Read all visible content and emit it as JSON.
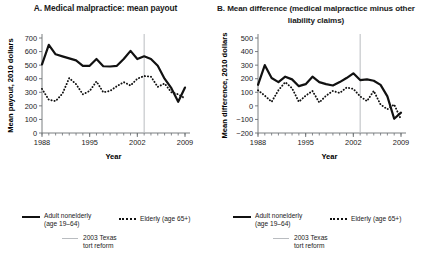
{
  "figure": {
    "panels": [
      {
        "id": "A",
        "title": "A. Medical malpractice:\nmean payout",
        "ylabel": "Mean payout, 2010 dollars",
        "xlabel": "Year"
      },
      {
        "id": "B",
        "title": "B. Mean difference (medical malpractice\nminus other liability claims)",
        "ylabel": "Mean difference, 2010 dollars",
        "xlabel": "Year"
      }
    ]
  },
  "legend": {
    "solid_label": "Adult nonelderly\n(age 19–64)",
    "dotted_label": "Elderly (age 65+)",
    "vline_label": "2003 Texas\ntort reform"
  },
  "colors": {
    "series_line": "#111111",
    "reform_line": "#b9bcc0",
    "axis": "#6b6f73",
    "text": "#1a1a1a",
    "background": "#ffffff"
  },
  "chart_data": [
    {
      "type": "line",
      "panel": "A",
      "title": "A. Medical malpractice: mean payout",
      "xlabel": "Year",
      "ylabel": "Mean payout, 2010 dollars",
      "xlim": [
        1988,
        2009
      ],
      "ylim": [
        0,
        700
      ],
      "ytick_values": [
        0,
        100,
        200,
        300,
        400,
        500,
        600,
        700
      ],
      "ytick_labels": [
        "0",
        "100",
        "200",
        "300",
        "400",
        "500",
        "600",
        "700"
      ],
      "xtick_values": [
        1988,
        1995,
        2002,
        2009
      ],
      "xtick_labels": [
        "1988",
        "1995",
        "2002",
        "2009"
      ],
      "minor_xticks": true,
      "grid": false,
      "legend_position": "below",
      "annotations": [
        {
          "type": "vline",
          "x": 2003,
          "label": "2003 Texas tort reform",
          "color": "#b9bcc0"
        }
      ],
      "x": [
        1988,
        1989,
        1990,
        1991,
        1992,
        1993,
        1994,
        1995,
        1996,
        1997,
        1998,
        1999,
        2000,
        2001,
        2002,
        2003,
        2004,
        2005,
        2006,
        2007,
        2008,
        2009
      ],
      "series": [
        {
          "name": "Adult nonelderly (age 19–64)",
          "style": "solid",
          "values": [
            505,
            650,
            580,
            565,
            550,
            535,
            495,
            495,
            545,
            492,
            490,
            495,
            545,
            605,
            545,
            565,
            545,
            495,
            400,
            330,
            230,
            335
          ]
        },
        {
          "name": "Elderly (age 65+)",
          "style": "dotted",
          "values": [
            325,
            245,
            235,
            290,
            405,
            360,
            285,
            310,
            380,
            300,
            310,
            345,
            375,
            350,
            400,
            420,
            415,
            340,
            365,
            300,
            285,
            255
          ]
        }
      ]
    },
    {
      "type": "line",
      "panel": "B",
      "title": "B. Mean difference (medical malpractice minus other liability claims)",
      "xlabel": "Year",
      "ylabel": "Mean difference, 2010 dollars",
      "xlim": [
        1988,
        2009
      ],
      "ylim": [
        -200,
        500
      ],
      "ytick_values": [
        -200,
        -100,
        0,
        100,
        200,
        300,
        400,
        500
      ],
      "ytick_labels": [
        "−200",
        "−100",
        "0",
        "100",
        "200",
        "300",
        "400",
        "500"
      ],
      "xtick_values": [
        1988,
        1995,
        2002,
        2009
      ],
      "xtick_labels": [
        "1988",
        "1995",
        "2002",
        "2009"
      ],
      "minor_xticks": true,
      "grid": false,
      "legend_position": "below",
      "annotations": [
        {
          "type": "vline",
          "x": 2003,
          "label": "2003 Texas tort reform",
          "color": "#b9bcc0"
        }
      ],
      "x": [
        1988,
        1989,
        1990,
        1991,
        1992,
        1993,
        1994,
        1995,
        1996,
        1997,
        1998,
        1999,
        2000,
        2001,
        2002,
        2003,
        2004,
        2005,
        2006,
        2007,
        2008,
        2009
      ],
      "series": [
        {
          "name": "Adult nonelderly (age 19–64)",
          "style": "solid",
          "values": [
            155,
            300,
            205,
            175,
            215,
            195,
            145,
            160,
            215,
            175,
            160,
            150,
            175,
            205,
            240,
            190,
            195,
            185,
            155,
            70,
            -95,
            -50
          ]
        },
        {
          "name": "Elderly (age 65+)",
          "style": "dotted",
          "values": [
            115,
            75,
            30,
            115,
            175,
            130,
            30,
            75,
            110,
            25,
            75,
            110,
            95,
            135,
            125,
            70,
            35,
            110,
            10,
            -25,
            10,
            -100
          ]
        }
      ]
    }
  ]
}
